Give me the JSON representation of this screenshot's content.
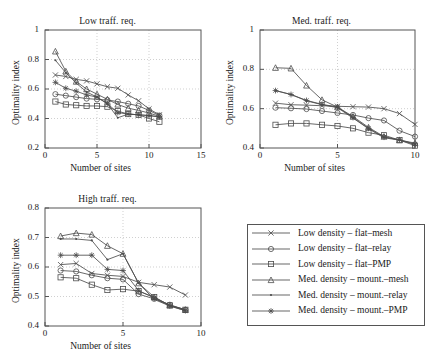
{
  "figure": {
    "background": "#ffffff",
    "line_color": "#4d4d4d",
    "axis_color": "#555555",
    "grid_color": "#bbbbbb"
  },
  "legend": {
    "position": "bottom-right",
    "entries": [
      {
        "label": "Low density – flat–mesh",
        "marker": "x-icon",
        "key": "low_flat_mesh"
      },
      {
        "label": "Low density – flat–relay",
        "marker": "circle-icon",
        "key": "low_flat_relay"
      },
      {
        "label": "Low density – flat–PMP",
        "marker": "square-icon",
        "key": "low_flat_pmp"
      },
      {
        "label": "Med. density – mount.–mesh",
        "marker": "triangle-icon",
        "key": "med_mount_mesh"
      },
      {
        "label": "Med. density – mount.–relay",
        "marker": "dot-icon",
        "key": "med_mount_relay"
      },
      {
        "label": "Med. density – mount.–PMP",
        "marker": "asterisk-icon",
        "key": "med_mount_pmp"
      }
    ]
  },
  "chart_data": [
    {
      "id": "low",
      "type": "line",
      "title": "Low traff. req.",
      "xlabel": "Number of sites",
      "ylabel": "Optimality index",
      "xlim": [
        0,
        15
      ],
      "ylim": [
        0.2,
        1
      ],
      "xticks": [
        0,
        5,
        10,
        15
      ],
      "yticks": [
        0.2,
        0.4,
        0.6,
        0.8,
        1
      ],
      "xticklabels": [
        "0",
        "5",
        "10",
        "15"
      ],
      "yticklabels": [
        "0.2",
        "0.4",
        "0.6",
        "0.8",
        "1"
      ],
      "grid": true,
      "series": [
        {
          "name": "Low density – flat–mesh",
          "marker": "x-icon",
          "x": [
            1,
            2,
            3,
            4,
            5,
            6,
            7,
            8,
            9,
            10,
            11
          ],
          "values": [
            0.695,
            0.685,
            0.665,
            0.655,
            0.635,
            0.615,
            0.605,
            0.56,
            0.52,
            0.465,
            0.425
          ]
        },
        {
          "name": "Low density – flat–relay",
          "marker": "circle-icon",
          "x": [
            1,
            2,
            3,
            4,
            5,
            6,
            7,
            8,
            9,
            10,
            11
          ],
          "values": [
            0.565,
            0.555,
            0.545,
            0.535,
            0.53,
            0.525,
            0.515,
            0.5,
            0.485,
            0.455,
            0.42
          ]
        },
        {
          "name": "Low density – flat–PMP",
          "marker": "square-icon",
          "x": [
            1,
            2,
            3,
            4,
            5,
            6,
            7,
            8,
            9,
            10,
            11
          ],
          "values": [
            0.515,
            0.495,
            0.49,
            0.485,
            0.485,
            0.48,
            0.45,
            0.43,
            0.425,
            0.4,
            0.378
          ]
        },
        {
          "name": "Med. density – mount.–mesh",
          "marker": "triangle-icon",
          "x": [
            1,
            2,
            3,
            4,
            5,
            6,
            7,
            8,
            9,
            10,
            11
          ],
          "values": [
            0.855,
            0.72,
            0.65,
            0.6,
            0.565,
            0.53,
            0.495,
            0.47,
            0.455,
            0.437,
            0.415
          ]
        },
        {
          "name": "Med. density – mount.–relay",
          "marker": "dot-icon",
          "x": [
            1,
            2,
            3,
            4,
            5,
            6,
            7,
            8,
            9,
            10,
            11
          ],
          "values": [
            0.795,
            0.71,
            0.64,
            0.58,
            0.545,
            0.5,
            0.405,
            0.43,
            0.425,
            0.42,
            0.41
          ]
        },
        {
          "name": "Med. density – mount.–PMP",
          "marker": "asterisk-icon",
          "x": [
            1,
            2,
            3,
            4,
            5,
            6,
            7,
            8,
            9,
            10,
            11
          ],
          "values": [
            0.645,
            0.605,
            0.585,
            0.56,
            0.545,
            0.5,
            0.44,
            0.43,
            0.425,
            0.42,
            0.412
          ]
        }
      ]
    },
    {
      "id": "med",
      "type": "line",
      "title": "Med. traff. req.",
      "xlabel": "Number of sites",
      "ylabel": "Optimality index",
      "xlim": [
        0,
        10
      ],
      "ylim": [
        0.4,
        1
      ],
      "xticks": [
        0,
        5,
        10
      ],
      "yticks": [
        0.4,
        0.6,
        0.8,
        1
      ],
      "xticklabels": [
        "0",
        "5",
        "10"
      ],
      "yticklabels": [
        "0.4",
        "0.6",
        "0.8",
        "1"
      ],
      "grid": true,
      "series": [
        {
          "name": "Low density – flat–mesh",
          "marker": "x-icon",
          "x": [
            1,
            2,
            3,
            4,
            5,
            6,
            7,
            8,
            9,
            10
          ],
          "values": [
            0.628,
            0.62,
            0.618,
            0.615,
            0.612,
            0.61,
            0.608,
            0.6,
            0.575,
            0.52
          ]
        },
        {
          "name": "Low density – flat–relay",
          "marker": "circle-icon",
          "x": [
            1,
            2,
            3,
            4,
            5,
            6,
            7,
            8,
            9,
            10
          ],
          "values": [
            0.605,
            0.602,
            0.598,
            0.588,
            0.578,
            0.568,
            0.552,
            0.54,
            0.488,
            0.458
          ]
        },
        {
          "name": "Low density – flat–PMP",
          "marker": "square-icon",
          "x": [
            1,
            2,
            3,
            4,
            5,
            6,
            7,
            8,
            9,
            10
          ],
          "values": [
            0.518,
            0.525,
            0.525,
            0.518,
            0.512,
            0.5,
            0.478,
            0.465,
            0.44,
            0.412
          ]
        },
        {
          "name": "Med. density – mount.–mesh",
          "marker": "triangle-icon",
          "x": [
            1,
            2,
            3,
            4,
            5,
            6,
            7,
            8,
            9,
            10
          ],
          "values": [
            0.808,
            0.805,
            0.718,
            0.645,
            0.608,
            0.56,
            0.505,
            0.458,
            0.44,
            0.425
          ]
        },
        {
          "name": "Med. density – mount.–relay",
          "marker": "dot-icon",
          "x": [
            1,
            2,
            3,
            4,
            5,
            6,
            7,
            8,
            9,
            10
          ],
          "values": [
            0.692,
            0.672,
            0.64,
            0.62,
            0.605,
            0.552,
            0.498,
            0.452,
            0.44,
            0.418
          ]
        },
        {
          "name": "Med. density – mount.–PMP",
          "marker": "asterisk-icon",
          "x": [
            1,
            2,
            3,
            4,
            5,
            6,
            7,
            8,
            9,
            10
          ],
          "values": [
            0.692,
            0.672,
            0.642,
            0.622,
            0.608,
            0.555,
            0.5,
            0.455,
            0.442,
            0.42
          ]
        }
      ]
    },
    {
      "id": "high",
      "type": "line",
      "title": "High traff. req.",
      "xlabel": "Number of sites",
      "ylabel": "Optimality index",
      "xlim": [
        0,
        10
      ],
      "ylim": [
        0.4,
        0.8
      ],
      "xticks": [
        0,
        5,
        10
      ],
      "yticks": [
        0.4,
        0.5,
        0.6,
        0.7,
        0.8
      ],
      "xticklabels": [
        "0",
        "5",
        "10"
      ],
      "yticklabels": [
        "0.4",
        "0.5",
        "0.6",
        "0.7",
        "0.8"
      ],
      "grid": true,
      "series": [
        {
          "name": "Low density – flat–mesh",
          "marker": "x-icon",
          "x": [
            1,
            2,
            3,
            4,
            5,
            6,
            7,
            8,
            9
          ],
          "values": [
            0.608,
            0.612,
            0.578,
            0.572,
            0.568,
            0.548,
            0.54,
            0.532,
            0.505
          ]
        },
        {
          "name": "Low density – flat–relay",
          "marker": "circle-icon",
          "x": [
            1,
            2,
            3,
            4,
            5,
            6,
            7,
            8,
            9
          ],
          "values": [
            0.588,
            0.585,
            0.572,
            0.562,
            0.558,
            0.508,
            0.492,
            0.472,
            0.455
          ]
        },
        {
          "name": "Low density – flat–PMP",
          "marker": "square-icon",
          "x": [
            1,
            2,
            3,
            4,
            5,
            6,
            7,
            8,
            9
          ],
          "values": [
            0.565,
            0.562,
            0.54,
            0.522,
            0.525,
            0.518,
            0.498,
            0.47,
            0.455
          ]
        },
        {
          "name": "Med. density – mount.–mesh",
          "marker": "triangle-icon",
          "x": [
            1,
            2,
            3,
            4,
            5,
            6,
            7,
            8,
            9
          ],
          "values": [
            0.705,
            0.715,
            0.71,
            0.672,
            0.645,
            0.545,
            0.498,
            0.47,
            0.455
          ]
        },
        {
          "name": "Med. density – mount.–relay",
          "marker": "dot-icon",
          "x": [
            1,
            2,
            3,
            4,
            5,
            6,
            7,
            8,
            9
          ],
          "values": [
            0.695,
            0.695,
            0.69,
            0.625,
            0.645,
            0.545,
            0.49,
            0.468,
            0.452
          ]
        },
        {
          "name": "Med. density – mount.–PMP",
          "marker": "asterisk-icon",
          "x": [
            1,
            2,
            3,
            4,
            5,
            6,
            7,
            8,
            9
          ],
          "values": [
            0.64,
            0.64,
            0.64,
            0.592,
            0.588,
            0.52,
            0.495,
            0.468,
            0.452
          ]
        }
      ]
    }
  ]
}
